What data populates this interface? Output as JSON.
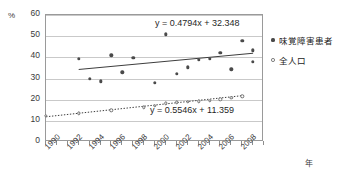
{
  "chart_data": {
    "type": "scatter",
    "title": "",
    "xlabel": "年",
    "ylabel": "%",
    "ylim": [
      0,
      60
    ],
    "ytick_step": 10,
    "yticks": [
      "60",
      "50",
      "40",
      "30",
      "20",
      "10",
      "0"
    ],
    "xlim": [
      1990,
      2010
    ],
    "xticks": [
      "1990",
      "1992",
      "1994",
      "1996",
      "1998",
      "2000",
      "2002",
      "2004",
      "2006",
      "2008"
    ],
    "xtick_step": 2,
    "grid": "horizontal",
    "legend_position": "right",
    "series": [
      {
        "name": "味覚障害患者",
        "marker": "filled-diamond",
        "color": "#4a4a4a",
        "trendline": {
          "style": "solid",
          "equation": "y = 0.4794x + 32.348",
          "slope": 0.4794,
          "intercept": 32.348
        },
        "x": [
          1993,
          1994,
          1995,
          1996,
          1997,
          1998,
          2000,
          2001,
          2002,
          2003,
          2004,
          2005,
          2006,
          2007,
          2008,
          2009
        ],
        "values": [
          39.3,
          29.8,
          28.7,
          40.9,
          32.9,
          39.7,
          28.1,
          50.9,
          32.1,
          35.3,
          38.9,
          39.4,
          42.1,
          34.3,
          47.8,
          43.3
        ]
      },
      {
        "name": "全人口",
        "marker": "open-circle",
        "color": "#6d6d6d",
        "trendline": {
          "style": "dotted",
          "equation": "y = 0.5546x + 11.359",
          "slope": 0.5546,
          "intercept": 11.359
        },
        "x": [
          1990,
          1993,
          1996,
          1999,
          2000,
          2001,
          2002,
          2003,
          2004,
          2005,
          2006,
          2007,
          2008
        ],
        "values": [
          12.3,
          13.6,
          14.9,
          16.4,
          17.2,
          18.3,
          18.7,
          19.0,
          19.3,
          19.6,
          20.1,
          20.9,
          21.5
        ]
      }
    ],
    "extra_points": {
      "series_1_tail_x": [
        2009
      ],
      "series_1_tail_values": [
        38.0
      ]
    },
    "annotations": [
      {
        "text": "y = 0.4794x + 32.348",
        "series": "味覚障害患者"
      },
      {
        "text": "y = 0.5546x + 11.359",
        "series": "全人口"
      }
    ]
  },
  "axis": {
    "y_unit": "%",
    "x_unit": "年"
  },
  "legend": {
    "items": [
      {
        "label": "味覚障害患者",
        "marker": "filled-diamond"
      },
      {
        "label": "全人口",
        "marker": "open-circle"
      }
    ]
  },
  "colors": {
    "frame": "#9a9a9a",
    "grid": "#c9c9c9",
    "series1": "#4a4a4a",
    "series2": "#6d6d6d",
    "text": "#333333",
    "background": "#ffffff"
  }
}
